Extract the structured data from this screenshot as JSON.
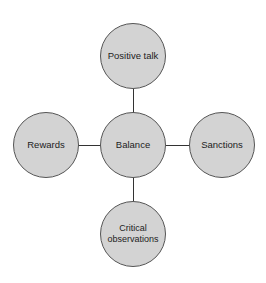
{
  "diagram": {
    "center": {
      "label": "Balance"
    },
    "nodes": {
      "top": {
        "label": "Positive talk"
      },
      "left": {
        "label": "Rewards"
      },
      "right": {
        "label": "Sanctions"
      },
      "bottom": {
        "label": "Critical observations"
      }
    },
    "colors": {
      "node_fill": "#d3d3d3",
      "stroke": "#333333"
    }
  }
}
